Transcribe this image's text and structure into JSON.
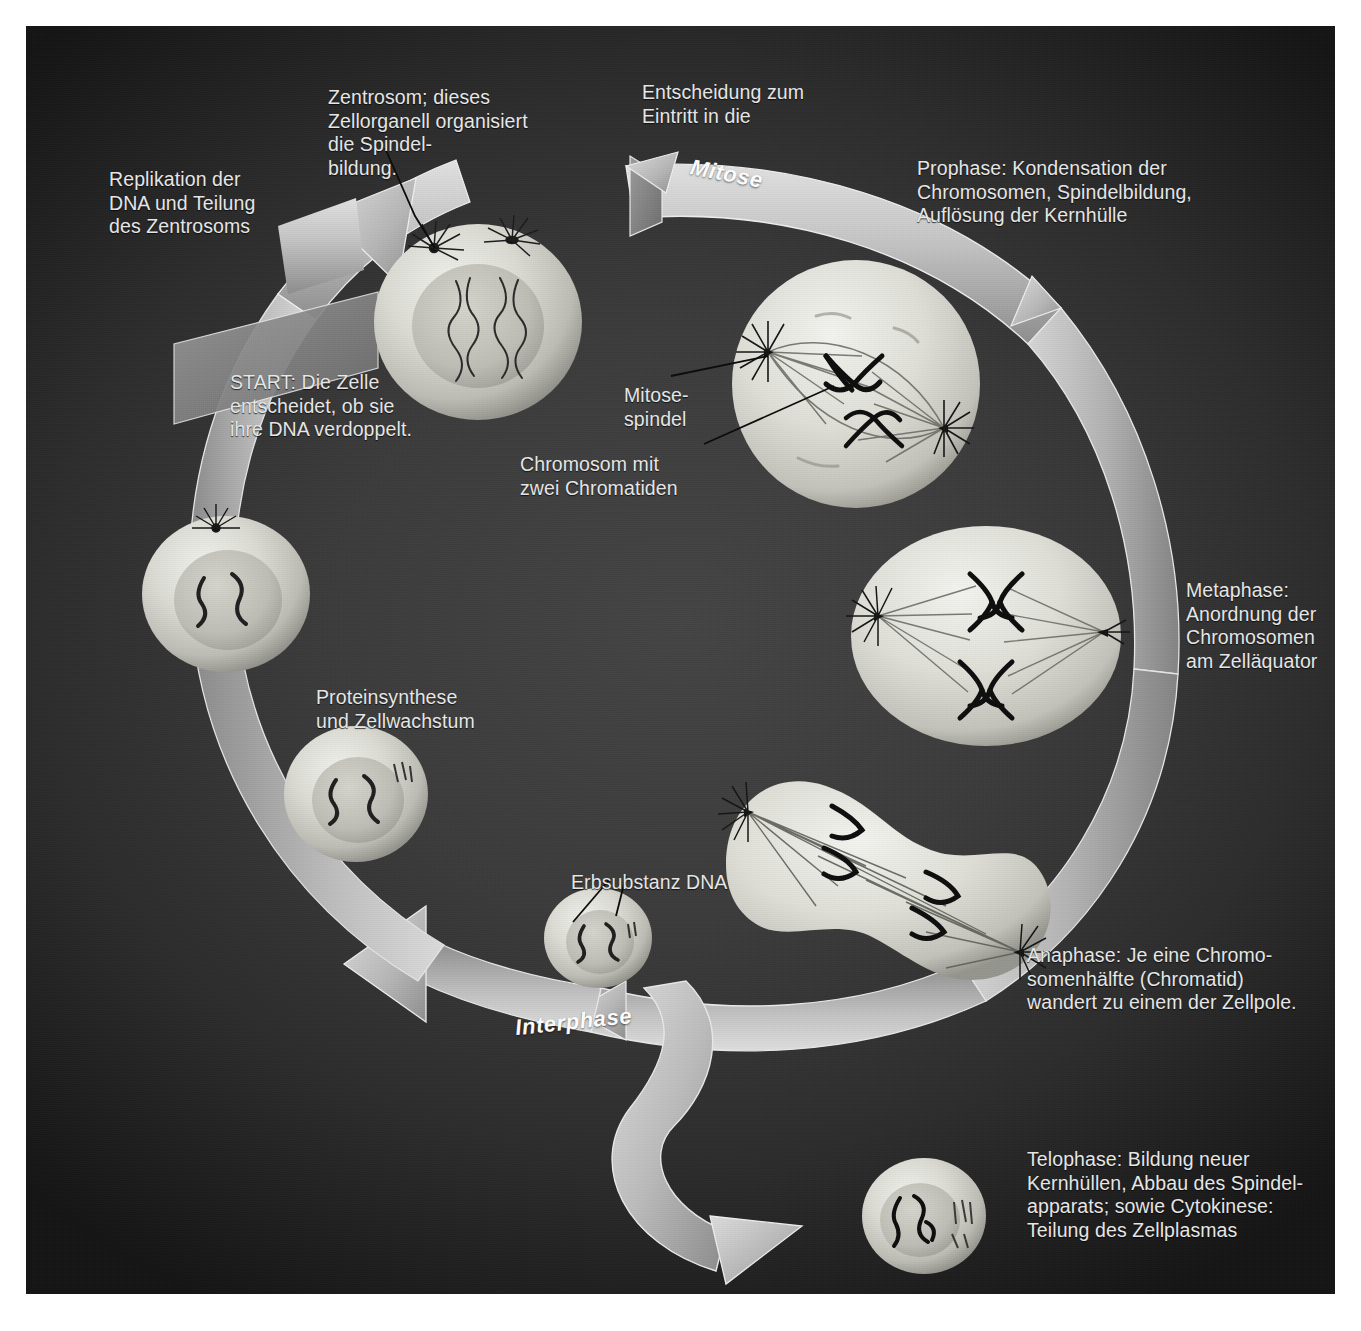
{
  "diagram": {
    "cycle_bands": [
      {
        "name": "mitose-band",
        "label": "Mitose"
      },
      {
        "name": "interphase-band",
        "label": "Interphase"
      }
    ],
    "captions": [
      {
        "name": "caption-zentrosom",
        "text": "Zentrosom; dieses\nZellorganell organisiert\ndie Spindel-\nbildung."
      },
      {
        "name": "caption-entscheidung-mitose",
        "text": "Entscheidung zum\nEintritt in die"
      },
      {
        "name": "caption-prophase",
        "text": "Prophase: Kondensation der\nChromosomen, Spindelbildung,\nAuflösung der Kernhülle"
      },
      {
        "name": "caption-replikation",
        "text": "Replikation der\nDNA und Teilung\ndes Zentrosoms"
      },
      {
        "name": "caption-start",
        "text": "START: Die Zelle\nentscheidet, ob sie\nihre DNA verdoppelt."
      },
      {
        "name": "caption-mitosespindel",
        "text": "Mitose-\nspindel"
      },
      {
        "name": "caption-chromosom",
        "text": "Chromosom mit\nzwei Chromatiden"
      },
      {
        "name": "caption-metaphase",
        "text": "Metaphase:\nAnordnung der\nChromosomen\nam Zelläquator"
      },
      {
        "name": "caption-proteinsynthese",
        "text": "Proteinsynthese\nund Zellwachstum"
      },
      {
        "name": "caption-erbsubstanz",
        "text": "Erbsubstanz DNA"
      },
      {
        "name": "caption-anaphase",
        "text": "Anaphase: Je eine Chromo-\nsomenhälfte (Chromatid)\nwandert zu einem der Zellpole."
      },
      {
        "name": "caption-telophase",
        "text": "Telophase: Bildung neuer\nKernhüllen, Abbau des Spindel-\napparats; sowie Cytokinese:\nTeilung des Zellplasmas"
      }
    ],
    "cells": [
      {
        "name": "cell-g1-start",
        "phase": "G1 / Start"
      },
      {
        "name": "cell-prophase",
        "phase": "Prophase"
      },
      {
        "name": "cell-metaphase",
        "phase": "Metaphase"
      },
      {
        "name": "cell-anaphase",
        "phase": "Anaphase"
      },
      {
        "name": "cell-telophase",
        "phase": "Telophase"
      },
      {
        "name": "cell-g1-small",
        "phase": "G1"
      },
      {
        "name": "cell-s-phase",
        "phase": "S-Phase"
      },
      {
        "name": "cell-g2-phase",
        "phase": "G2-Phase"
      }
    ],
    "colors": {
      "background_center": "#444444",
      "background_edge": "#141414",
      "arrow_light": "#d2d2d2",
      "arrow_mid": "#a8a8a8",
      "arrow_dark": "#8a8a8a",
      "cell_body": "#dcdcd6",
      "nucleus": "#c2c2ba",
      "chromatin": "#1a1a1a",
      "text": "#e9e9e9",
      "band_label": "#ffffff"
    }
  }
}
